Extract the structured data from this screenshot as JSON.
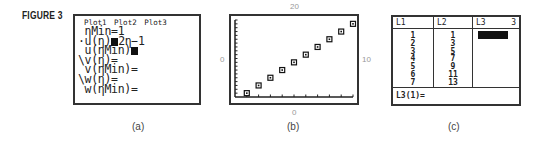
{
  "figure_label": "FIGURE 3",
  "panel_a": {
    "caption": "(a)",
    "plots": [
      "Plot1",
      "Plot2",
      "Plot3"
    ],
    "lines": {
      "nmin": " ηMin=1",
      "u_n_prefix": "·u(η)",
      "u_n_expr": "2η−1",
      "u_nmin": " u(ηMin)",
      "v_n": "\\v(η)=",
      "v_nmin": " v(ηMin)=",
      "w_n": "\\w(η)=",
      "w_nmin": " w(ηMin)="
    }
  },
  "panel_b": {
    "caption": "(b)",
    "axis_labels": {
      "top": "20",
      "left": "0",
      "right": "10",
      "bottom": "0"
    }
  },
  "panel_c": {
    "caption": "(c)",
    "columns": [
      {
        "header": "L1",
        "values": [
          "1",
          "2",
          "3",
          "4",
          "5",
          "6",
          "7"
        ]
      },
      {
        "header": "L2",
        "values": [
          "1",
          "3",
          "5",
          "7",
          "9",
          "11",
          "13"
        ]
      },
      {
        "header": "L3",
        "header_right": "3",
        "values": []
      }
    ],
    "entry_line": "L3(1)="
  },
  "chart_data": {
    "type": "scatter",
    "title": "",
    "xlabel": "",
    "ylabel": "",
    "xlim": [
      0,
      10
    ],
    "ylim": [
      0,
      20
    ],
    "x": [
      1,
      2,
      3,
      4,
      5,
      6,
      7,
      8,
      9,
      10
    ],
    "y": [
      1,
      3,
      5,
      7,
      9,
      11,
      13,
      15,
      17,
      19
    ],
    "series": [
      {
        "name": "u(n)=2n-1",
        "x": [
          1,
          2,
          3,
          4,
          5,
          6,
          7,
          8,
          9,
          10
        ],
        "y": [
          1,
          3,
          5,
          7,
          9,
          11,
          13,
          15,
          17,
          19
        ]
      }
    ],
    "axis_window_labels": {
      "ymax": "20",
      "xmin": "0",
      "xmax": "10",
      "ymin": "0"
    },
    "grid": false,
    "tick_marks": true,
    "marker": "square"
  }
}
